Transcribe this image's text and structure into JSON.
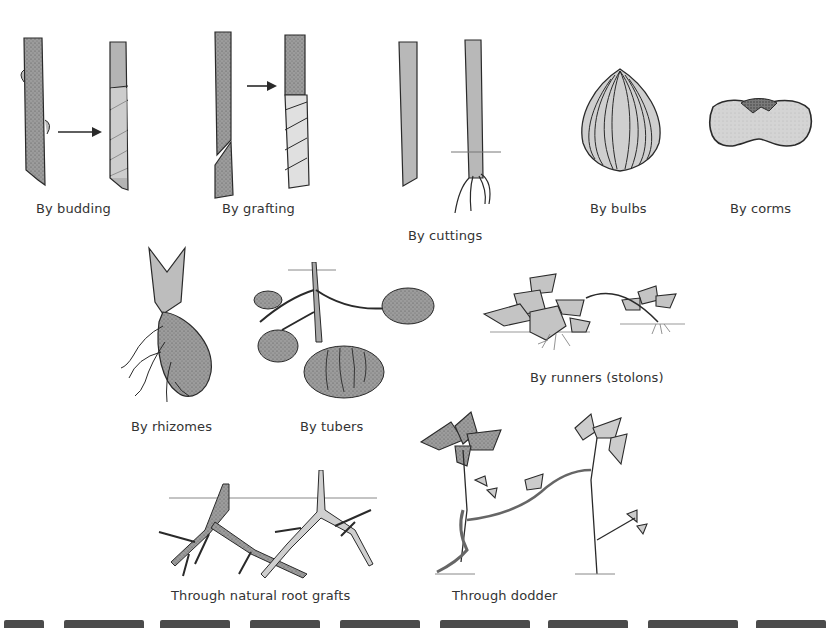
{
  "figure": {
    "panels": [
      {
        "id": "budding",
        "label": "By budding"
      },
      {
        "id": "grafting",
        "label": "By grafting"
      },
      {
        "id": "cuttings",
        "label": "By cuttings"
      },
      {
        "id": "bulbs",
        "label": "By bulbs"
      },
      {
        "id": "corms",
        "label": "By corms"
      },
      {
        "id": "rhizomes",
        "label": "By rhizomes"
      },
      {
        "id": "tubers",
        "label": "By tubers"
      },
      {
        "id": "runners",
        "label": "By runners (stolons)"
      },
      {
        "id": "root-grafts",
        "label": "Through natural root grafts"
      },
      {
        "id": "dodder",
        "label": "Through dodder"
      }
    ],
    "arrows": [
      {
        "panel": "budding",
        "icon": "right-arrow-icon"
      },
      {
        "panel": "grafting",
        "icon": "right-arrow-icon"
      }
    ],
    "colors": {
      "stem_fill": "#9a9a9a",
      "light_fill": "#d2d2d2",
      "ink": "#2a2a2a",
      "background": "#ffffff"
    }
  }
}
